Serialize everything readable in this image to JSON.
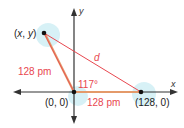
{
  "diagram": {
    "points": {
      "xy": {
        "label_pre": "(",
        "x_var": "x",
        "comma": ", ",
        "y_var": "y",
        "label_post": ")"
      },
      "origin": {
        "label": "(0, 0)"
      },
      "p128": {
        "label": "(128, 0)"
      }
    },
    "axes": {
      "x_label": "x",
      "y_label": "y"
    },
    "side_labels": {
      "left_side": "128 pm",
      "bottom_side": "128 pm",
      "hypotenuse": "d"
    },
    "angle_label": "117°",
    "colors": {
      "axis": "#333333",
      "triangle_red": "#e8474f",
      "side_highlight": "#e49a6a",
      "label_red": "#e8474f",
      "glow": "#cdeef4",
      "text": "#222222"
    }
  }
}
